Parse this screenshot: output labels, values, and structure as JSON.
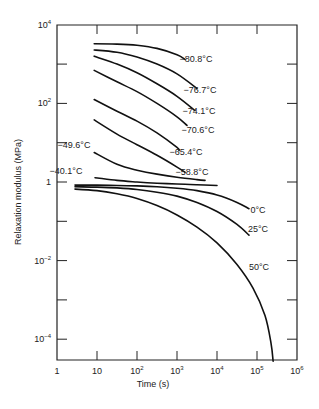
{
  "chart_data": {
    "type": "line",
    "title": "",
    "xlabel": "Time (s)",
    "ylabel": "Relaxation modulus (MPa)",
    "xscale": "log",
    "yscale": "log",
    "xlim": [
      1,
      1000000
    ],
    "ylim": [
      5e-05,
      10000
    ],
    "grid": false,
    "legend": "none (inline curve labels)",
    "x_ticks": [
      {
        "value": 1,
        "base": "1",
        "exp": ""
      },
      {
        "value": 10,
        "base": "10",
        "exp": ""
      },
      {
        "value": 100,
        "base": "10",
        "exp": "2"
      },
      {
        "value": 1000,
        "base": "10",
        "exp": "3"
      },
      {
        "value": 10000,
        "base": "10",
        "exp": "4"
      },
      {
        "value": 100000,
        "base": "10",
        "exp": "5"
      },
      {
        "value": 1000000,
        "base": "10",
        "exp": "6"
      }
    ],
    "y_ticks": [
      {
        "value": 10000,
        "base": "10",
        "exp": "4"
      },
      {
        "value": 100,
        "base": "10",
        "exp": "2"
      },
      {
        "value": 1,
        "base": "1",
        "exp": ""
      },
      {
        "value": 0.01,
        "base": "10",
        "exp": "−2"
      },
      {
        "value": 0.0001,
        "base": "10",
        "exp": "−4"
      }
    ],
    "series": [
      {
        "name": "−80.8°C",
        "logx": [
          0.93,
          1.5,
          2.0,
          2.5,
          3.0,
          3.2
        ],
        "logy": [
          3.52,
          3.51,
          3.48,
          3.4,
          3.24,
          3.12
        ],
        "label_pos": [
          196,
          62
        ]
      },
      {
        "name": "−76.7°C",
        "logx": [
          0.93,
          1.5,
          2.0,
          2.5,
          3.0,
          3.5
        ],
        "logy": [
          3.36,
          3.3,
          3.18,
          3.0,
          2.75,
          2.38
        ],
        "label_pos": [
          200,
          93
        ]
      },
      {
        "name": "−74.1°C",
        "logx": [
          0.93,
          1.5,
          2.0,
          2.5,
          3.0,
          3.45
        ],
        "logy": [
          3.2,
          3.0,
          2.78,
          2.5,
          2.18,
          1.82
        ],
        "label_pos": [
          199,
          114
        ]
      },
      {
        "name": "−70.6°C",
        "logx": [
          0.93,
          1.5,
          2.0,
          2.5,
          3.0,
          3.25
        ],
        "logy": [
          2.84,
          2.55,
          2.3,
          2.0,
          1.66,
          1.44
        ],
        "label_pos": [
          198,
          133
        ]
      },
      {
        "name": "−65.4°C",
        "logx": [
          0.93,
          1.5,
          2.0,
          2.5,
          3.0,
          3.05
        ],
        "logy": [
          2.1,
          1.8,
          1.55,
          1.25,
          0.88,
          0.8
        ],
        "label_pos": [
          186,
          155
        ]
      },
      {
        "name": "−58.8°C",
        "logx": [
          0.93,
          1.5,
          2.0,
          2.5,
          3.0,
          3.2
        ],
        "logy": [
          1.58,
          1.22,
          0.95,
          0.68,
          0.38,
          0.25
        ],
        "label_pos": [
          192,
          175
        ]
      },
      {
        "name": "−49.6°C",
        "logx": [
          0.93,
          1.5,
          2.0,
          2.5,
          3.0,
          3.5,
          3.7
        ],
        "logy": [
          0.75,
          0.45,
          0.3,
          0.2,
          0.12,
          0.06,
          0.04
        ],
        "label_pos": [
          74,
          148
        ]
      },
      {
        "name": "−40.1°C",
        "logx": [
          0.95,
          1.5,
          2.0,
          2.5,
          3.0,
          3.5,
          4.0
        ],
        "logy": [
          0.11,
          0.04,
          0.0,
          -0.03,
          -0.05,
          -0.07,
          -0.09
        ],
        "label_pos": [
          66,
          174
        ]
      },
      {
        "name": "0°C",
        "logx": [
          0.45,
          1.0,
          1.5,
          2.0,
          2.5,
          3.0,
          3.5,
          4.0,
          4.5,
          4.8
        ],
        "logy": [
          -0.08,
          -0.08,
          -0.09,
          -0.1,
          -0.12,
          -0.16,
          -0.22,
          -0.33,
          -0.52,
          -0.68
        ],
        "label_pos": [
          258,
          213
        ]
      },
      {
        "name": "25°C",
        "logx": [
          0.45,
          1.0,
          1.5,
          2.0,
          2.5,
          3.0,
          3.5,
          4.0,
          4.5,
          4.8
        ],
        "logy": [
          -0.12,
          -0.13,
          -0.15,
          -0.19,
          -0.26,
          -0.36,
          -0.52,
          -0.75,
          -1.08,
          -1.35
        ],
        "label_pos": [
          258,
          232
        ]
      },
      {
        "name": "50°C",
        "logx": [
          0.45,
          1.0,
          1.5,
          2.0,
          2.5,
          3.0,
          3.5,
          4.0,
          4.5,
          4.9,
          5.2,
          5.35,
          5.4,
          5.4
        ],
        "logy": [
          -0.18,
          -0.22,
          -0.3,
          -0.42,
          -0.6,
          -0.84,
          -1.15,
          -1.55,
          -2.1,
          -2.7,
          -3.4,
          -4.1,
          -4.6,
          -4.72
        ],
        "label_pos": [
          259,
          270
        ]
      }
    ]
  },
  "layout": {
    "plot_left": 57,
    "plot_right": 297,
    "plot_top": 25,
    "plot_bottom": 360,
    "px_per_decade_x": 40,
    "px_per_decade_y": 39.3,
    "y_origin_px": 182
  }
}
